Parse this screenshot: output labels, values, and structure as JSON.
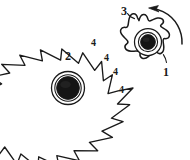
{
  "figure": {
    "type": "patent-line-drawing",
    "background_color": "#ffffff",
    "stroke_color": "#1a1a1a",
    "hub_fill_color": "#151515",
    "callouts": [
      {
        "id": "c1",
        "text": "1",
        "x": 163,
        "y": 66,
        "size": "big",
        "refers_to": "small-gear"
      },
      {
        "id": "c2",
        "text": "2",
        "x": 65,
        "y": 50,
        "size": "big",
        "refers_to": "large-gear"
      },
      {
        "id": "c3",
        "text": "3",
        "x": 121,
        "y": 5,
        "size": "big",
        "refers_to": "rotation-arrow"
      },
      {
        "id": "c4a",
        "text": "4",
        "x": 91,
        "y": 38,
        "size": "small",
        "refers_to": "gear-tooth"
      },
      {
        "id": "c4b",
        "text": "4",
        "x": 104,
        "y": 53,
        "size": "small",
        "refers_to": "gear-tooth"
      },
      {
        "id": "c4c",
        "text": "4",
        "x": 113,
        "y": 67,
        "size": "small",
        "refers_to": "gear-tooth"
      },
      {
        "id": "c4d",
        "text": "4",
        "x": 119,
        "y": 85,
        "size": "small",
        "refers_to": "gear-tooth"
      }
    ],
    "large_gear": {
      "label": "2",
      "center_x": 68,
      "center_y": 88,
      "tip_radius": 65,
      "root_radius": 52,
      "tooth_count": 20,
      "hub_outer_radius": 16,
      "hub_inner_radius": 12
    },
    "small_gear": {
      "label": "1",
      "center_x": 148,
      "center_y": 43,
      "body_radius": 24,
      "tooth_count": 7,
      "hub_outer_radius": 13,
      "hub_inner_radius": 7
    },
    "rotation_arrow": {
      "label": "3",
      "direction": "counterclockwise",
      "description": "curved arrow above and right of small gear pointing up-left"
    }
  }
}
